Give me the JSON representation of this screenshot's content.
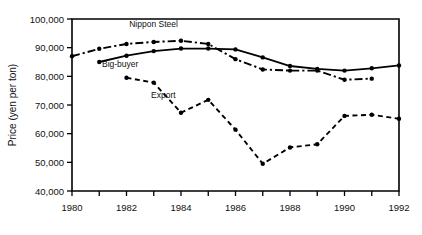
{
  "chart_data": {
    "type": "line",
    "title": "",
    "xlabel": "",
    "ylabel": "Price (yen per ton)",
    "xlim": [
      1980,
      1992
    ],
    "ylim": [
      40000,
      100000
    ],
    "grid": false,
    "legend_position": "inline-annotations",
    "x_ticks": [
      1980,
      1981,
      1982,
      1983,
      1984,
      1985,
      1986,
      1987,
      1988,
      1989,
      1990,
      1991,
      1992
    ],
    "x_tick_labels": [
      "1980",
      "",
      "1982",
      "",
      "1984",
      "",
      "1986",
      "",
      "1988",
      "",
      "1990",
      "",
      "1992"
    ],
    "y_ticks": [
      40000,
      50000,
      60000,
      70000,
      80000,
      90000,
      100000
    ],
    "y_tick_labels": [
      "40,000",
      "50,000",
      "60,000",
      "70,000",
      "80,000",
      "90,000",
      "100,000"
    ],
    "series": [
      {
        "name": "Nippon Steel",
        "style": "dash-dot",
        "label_x": 1982.1,
        "label_y": 97200,
        "x": [
          1980,
          1981,
          1982,
          1983,
          1984,
          1985,
          1986,
          1987,
          1988,
          1989,
          1990,
          1991
        ],
        "values": [
          87000,
          89600,
          91300,
          92000,
          92400,
          91300,
          86000,
          82400,
          82000,
          82000,
          78800,
          79200
        ]
      },
      {
        "name": "Big-buyer",
        "style": "solid",
        "label_x": 1981.1,
        "label_y": 83200,
        "x": [
          1981,
          1982,
          1983,
          1984,
          1985,
          1986,
          1987,
          1988,
          1989,
          1990,
          1991,
          1992
        ],
        "values": [
          85000,
          87200,
          88800,
          89700,
          89700,
          89400,
          86600,
          83600,
          82600,
          82000,
          82800,
          83800
        ]
      },
      {
        "name": "Export",
        "style": "dashed",
        "label_x": 1982.9,
        "label_y": 72600,
        "x": [
          1982,
          1983,
          1984,
          1985,
          1986,
          1987,
          1988,
          1989,
          1990,
          1991,
          1992
        ],
        "values": [
          79500,
          77800,
          67300,
          71800,
          61400,
          49500,
          55200,
          56300,
          66200,
          66600,
          65200
        ]
      }
    ]
  }
}
